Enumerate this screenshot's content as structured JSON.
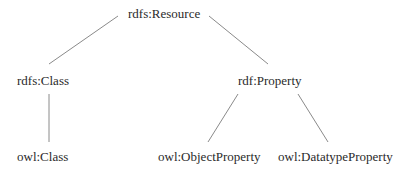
{
  "diagram": {
    "type": "hierarchy",
    "colors": {
      "text": "#2a2a2a",
      "edge": "#8a8a8a",
      "background": "#ffffff"
    },
    "nodes": {
      "root": {
        "label": "rdfs:Resource",
        "x": 128,
        "y": 6
      },
      "rdfs_class": {
        "label": "rdfs:Class",
        "x": 17,
        "y": 73
      },
      "rdf_property": {
        "label": "rdf:Property",
        "x": 238,
        "y": 73
      },
      "owl_class": {
        "label": "owl:Class",
        "x": 17,
        "y": 149
      },
      "owl_object_property": {
        "label": "owl:ObjectProperty",
        "x": 158,
        "y": 149
      },
      "owl_datatype_property": {
        "label": "owl:DatatypeProperty",
        "x": 278,
        "y": 149
      }
    },
    "edges": [
      {
        "from": "rdfs:Resource",
        "to": "rdfs:Class",
        "x1": 118,
        "y1": 16,
        "x2": 49,
        "y2": 64
      },
      {
        "from": "rdfs:Resource",
        "to": "rdf:Property",
        "x1": 209,
        "y1": 16,
        "x2": 268,
        "y2": 64
      },
      {
        "from": "rdfs:Class",
        "to": "owl:Class",
        "x1": 49,
        "y1": 94,
        "x2": 49,
        "y2": 142
      },
      {
        "from": "rdf:Property",
        "to": "owl:ObjectProperty",
        "x1": 238,
        "y1": 94,
        "x2": 208,
        "y2": 142
      },
      {
        "from": "rdf:Property",
        "to": "owl:DatatypeProperty",
        "x1": 298,
        "y1": 94,
        "x2": 328,
        "y2": 142
      }
    ]
  }
}
